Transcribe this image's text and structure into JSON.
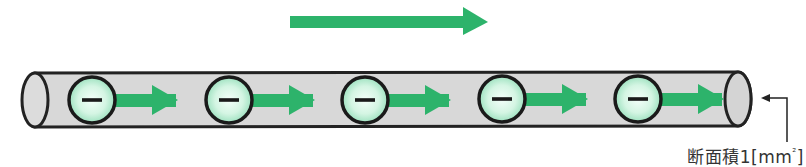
{
  "diagram": {
    "title": "",
    "current_direction_arrow": {
      "direction": "right",
      "color": "#2db36b"
    },
    "wire": {
      "fill": "#d6d6d6",
      "stroke": "#222222",
      "cross_section_label": "断面積1[mm²]",
      "cross_section_label_parts": {
        "prefix": "断面積1[mm",
        "superscript": "²",
        "suffix": "]"
      }
    },
    "electrons": [
      {
        "symbol": "−",
        "x": 92
      },
      {
        "symbol": "−",
        "x": 229
      },
      {
        "symbol": "−",
        "x": 365
      },
      {
        "symbol": "−",
        "x": 502
      },
      {
        "symbol": "−",
        "x": 638
      }
    ],
    "colors": {
      "arrow_green": "#2db36b",
      "electron_fill_center": "#f2fff8",
      "electron_fill_edge": "#9fe6c2",
      "outline": "#1a1a1a",
      "label_text": "#333333"
    }
  }
}
